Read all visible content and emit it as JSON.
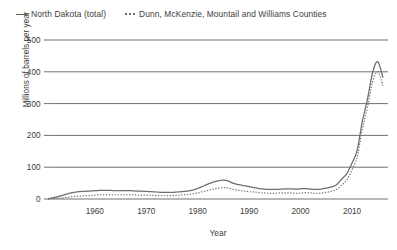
{
  "chart_data": {
    "type": "line",
    "title": "",
    "subtitle": "",
    "xlabel": "Year",
    "ylabel": "Millions of barrels per year",
    "xlim": [
      1951,
      2017
    ],
    "ylim": [
      0,
      500
    ],
    "yticks": [
      0,
      100,
      200,
      300,
      400,
      500
    ],
    "ytick_labels": [
      "0",
      "100",
      "200",
      "300",
      "400",
      "500"
    ],
    "xticks": [
      1960,
      1970,
      1980,
      1990,
      2000,
      2010
    ],
    "xtick_labels": [
      "1960",
      "1970",
      "1980",
      "1990",
      "2000",
      "2010"
    ],
    "grid": "horizontal",
    "legend_position": "above-plot-left",
    "x": [
      1951,
      1952,
      1953,
      1954,
      1955,
      1956,
      1957,
      1958,
      1959,
      1960,
      1961,
      1962,
      1963,
      1964,
      1965,
      1966,
      1967,
      1968,
      1969,
      1970,
      1971,
      1972,
      1973,
      1974,
      1975,
      1976,
      1977,
      1978,
      1979,
      1980,
      1981,
      1982,
      1983,
      1984,
      1985,
      1986,
      1987,
      1988,
      1989,
      1990,
      1991,
      1992,
      1993,
      1994,
      1995,
      1996,
      1997,
      1998,
      1999,
      2000,
      2001,
      2002,
      2003,
      2004,
      2005,
      2006,
      2007,
      2008,
      2009,
      2010,
      2011,
      2012,
      2013,
      2014,
      2015,
      2016
    ],
    "series": [
      {
        "name": "North Dakota (total)",
        "style": "solid",
        "color": "#6d6d6d",
        "values": [
          1,
          4,
          8,
          13,
          18,
          21,
          23,
          24,
          25,
          26,
          27,
          27,
          27,
          26,
          26,
          26,
          26,
          25,
          25,
          24,
          23,
          22,
          21,
          21,
          21,
          22,
          23,
          25,
          28,
          33,
          40,
          47,
          53,
          57,
          59,
          56,
          49,
          45,
          42,
          39,
          36,
          33,
          31,
          30,
          30,
          31,
          32,
          32,
          31,
          32,
          33,
          31,
          30,
          31,
          34,
          38,
          45,
          63,
          80,
          113,
          153,
          243,
          313,
          397,
          432,
          383
        ]
      },
      {
        "name": "Dunn, McKenzie, Mountail and Williams Counties",
        "style": "dotted",
        "color": "#6d6d6d",
        "values": [
          0,
          1,
          2,
          4,
          6,
          8,
          9,
          10,
          11,
          12,
          13,
          13,
          13,
          13,
          13,
          13,
          13,
          13,
          12,
          12,
          12,
          11,
          11,
          11,
          11,
          12,
          13,
          14,
          16,
          19,
          23,
          27,
          31,
          34,
          36,
          34,
          30,
          27,
          25,
          23,
          22,
          20,
          19,
          18,
          18,
          19,
          19,
          19,
          18,
          19,
          20,
          19,
          18,
          19,
          21,
          24,
          30,
          44,
          60,
          92,
          132,
          218,
          288,
          368,
          400,
          358
        ]
      }
    ],
    "notes": {
      "peak_total_year": 2015,
      "peak_total_value": 432,
      "bump_1985_total_value": 59
    }
  },
  "legend": {
    "entries": [
      {
        "label": "North Dakota (total)",
        "marker": "solid-line-swatch"
      },
      {
        "label": "Dunn, McKenzie, Mountail and Williams Counties",
        "marker": "dotted-line-swatch"
      }
    ]
  },
  "axes": {
    "x_title": "Year",
    "y_title": "Millions of barrels per year"
  }
}
